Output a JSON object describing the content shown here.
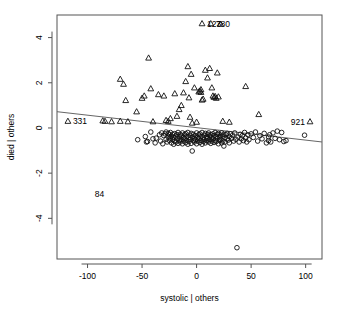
{
  "chart_data": {
    "type": "scatter",
    "title": "",
    "xlabel": "systolic | others",
    "ylabel": "died | others",
    "xlim": [
      -128,
      115
    ],
    "ylim": [
      -5.8,
      5.0
    ],
    "xticks": [
      -100,
      -50,
      0,
      50,
      100
    ],
    "xtick_labels": [
      "-100",
      "-50",
      "0",
      "50",
      "100"
    ],
    "yticks": [
      -4,
      -2,
      0,
      2,
      4
    ],
    "ytick_labels": [
      "-4",
      "-2",
      "0",
      "2",
      "4"
    ],
    "grid": false,
    "legend": "none",
    "regression_line": {
      "x0": -128,
      "y0": 0.72,
      "x1": 115,
      "y1": -0.62
    },
    "annotations": [
      {
        "label": "331",
        "x": -118,
        "y": 0.3,
        "marker": "triangle",
        "align": "right"
      },
      {
        "label": "921",
        "x": 104,
        "y": 0.28,
        "marker": "triangle",
        "align": "left"
      },
      {
        "label": "84",
        "x": -98,
        "y": -2.92,
        "marker": "circle",
        "align": "right"
      },
      {
        "label": "123",
        "x": 5,
        "y": 4.62,
        "marker": "triangle",
        "align": "right"
      },
      {
        "label": "780",
        "x": 13,
        "y": 4.62,
        "marker": "triangle",
        "align": "right"
      }
    ],
    "series": [
      {
        "name": "others (circle)",
        "marker": "circle",
        "points": [
          [
            -54,
            -0.52
          ],
          [
            -47,
            -0.38
          ],
          [
            -46,
            -0.62
          ],
          [
            -45,
            -0.6
          ],
          [
            -42,
            -0.18
          ],
          [
            -40,
            -0.48
          ],
          [
            -38,
            -0.66
          ],
          [
            -37,
            -0.45
          ],
          [
            -34,
            -0.3
          ],
          [
            -33,
            -0.58
          ],
          [
            -32,
            -0.22
          ],
          [
            -31,
            -0.7
          ],
          [
            -30,
            -0.34
          ],
          [
            -29,
            -0.26
          ],
          [
            -28,
            -0.5
          ],
          [
            -28,
            -0.18
          ],
          [
            -27,
            -0.62
          ],
          [
            -26,
            -0.4
          ],
          [
            -26,
            -0.24
          ],
          [
            -25,
            -0.55
          ],
          [
            -25,
            -0.3
          ],
          [
            -24,
            -0.44
          ],
          [
            -24,
            -0.2
          ],
          [
            -23,
            -0.66
          ],
          [
            -23,
            -0.36
          ],
          [
            -22,
            -0.52
          ],
          [
            -22,
            -0.28
          ],
          [
            -21,
            -0.72
          ],
          [
            -21,
            -0.42
          ],
          [
            -20,
            -0.25
          ],
          [
            -20,
            -0.58
          ],
          [
            -19,
            -0.36
          ],
          [
            -19,
            -0.62
          ],
          [
            -18,
            -0.3
          ],
          [
            -18,
            -0.48
          ],
          [
            -17,
            -0.2
          ],
          [
            -17,
            -0.68
          ],
          [
            -16,
            -0.4
          ],
          [
            -16,
            -0.55
          ],
          [
            -15,
            -0.28
          ],
          [
            -15,
            -0.62
          ],
          [
            -14,
            -0.35
          ],
          [
            -14,
            -0.5
          ],
          [
            -13,
            -0.22
          ],
          [
            -13,
            -0.7
          ],
          [
            -12,
            -0.42
          ],
          [
            -12,
            -0.58
          ],
          [
            -11,
            -0.3
          ],
          [
            -11,
            -0.48
          ],
          [
            -10,
            -0.25
          ],
          [
            -10,
            -0.65
          ],
          [
            -9,
            -0.38
          ],
          [
            -9,
            -0.54
          ],
          [
            -8,
            -0.2
          ],
          [
            -8,
            -0.72
          ],
          [
            -7,
            -0.44
          ],
          [
            -7,
            -0.6
          ],
          [
            -6,
            -0.32
          ],
          [
            -6,
            -0.5
          ],
          [
            -5,
            -0.24
          ],
          [
            -5,
            -0.68
          ],
          [
            -4,
            -0.4
          ],
          [
            -4,
            -1.02
          ],
          [
            -3,
            -0.56
          ],
          [
            -3,
            -0.28
          ],
          [
            -2,
            -0.46
          ],
          [
            -2,
            -0.62
          ],
          [
            -1,
            -0.34
          ],
          [
            -1,
            -0.52
          ],
          [
            0,
            -0.22
          ],
          [
            0,
            -0.7
          ],
          [
            1,
            -0.42
          ],
          [
            1,
            -0.58
          ],
          [
            2,
            -0.3
          ],
          [
            2,
            -0.48
          ],
          [
            3,
            -0.26
          ],
          [
            3,
            -0.64
          ],
          [
            4,
            -0.38
          ],
          [
            4,
            -0.54
          ],
          [
            5,
            -0.2
          ],
          [
            5,
            -0.72
          ],
          [
            6,
            -0.44
          ],
          [
            6,
            -0.6
          ],
          [
            7,
            -0.32
          ],
          [
            7,
            -0.5
          ],
          [
            8,
            -0.24
          ],
          [
            8,
            -0.66
          ],
          [
            9,
            -0.4
          ],
          [
            9,
            -0.56
          ],
          [
            10,
            -0.28
          ],
          [
            10,
            -0.46
          ],
          [
            11,
            -0.22
          ],
          [
            11,
            -0.62
          ],
          [
            12,
            -0.36
          ],
          [
            12,
            -0.52
          ],
          [
            13,
            -0.3
          ],
          [
            13,
            -0.68
          ],
          [
            14,
            -0.42
          ],
          [
            14,
            -0.58
          ],
          [
            15,
            -0.26
          ],
          [
            15,
            -0.48
          ],
          [
            16,
            -0.34
          ],
          [
            16,
            -0.64
          ],
          [
            17,
            -0.2
          ],
          [
            17,
            -0.54
          ],
          [
            18,
            -0.38
          ],
          [
            18,
            -0.6
          ],
          [
            19,
            -0.28
          ],
          [
            19,
            -0.46
          ],
          [
            20,
            -0.24
          ],
          [
            20,
            -0.7
          ],
          [
            21,
            -0.4
          ],
          [
            21,
            -0.56
          ],
          [
            22,
            -0.32
          ],
          [
            22,
            -0.5
          ],
          [
            23,
            -0.22
          ],
          [
            23,
            -0.66
          ],
          [
            24,
            -0.36
          ],
          [
            24,
            -0.58
          ],
          [
            25,
            -0.28
          ],
          [
            25,
            -0.8
          ],
          [
            26,
            -0.44
          ],
          [
            26,
            -0.62
          ],
          [
            27,
            -0.3
          ],
          [
            28,
            -0.48
          ],
          [
            28,
            -0.24
          ],
          [
            29,
            -0.54
          ],
          [
            30,
            -0.38
          ],
          [
            30,
            -0.66
          ],
          [
            31,
            -0.26
          ],
          [
            32,
            -0.46
          ],
          [
            33,
            -0.32
          ],
          [
            34,
            -0.58
          ],
          [
            35,
            -0.22
          ],
          [
            36,
            -0.5
          ],
          [
            37,
            -5.3
          ],
          [
            38,
            -0.4
          ],
          [
            39,
            -0.62
          ],
          [
            40,
            -0.28
          ],
          [
            41,
            -0.48
          ],
          [
            42,
            -0.34
          ],
          [
            43,
            -0.56
          ],
          [
            44,
            -0.2
          ],
          [
            45,
            -0.44
          ],
          [
            46,
            -0.62
          ],
          [
            47,
            -0.3
          ],
          [
            48,
            -0.52
          ],
          [
            50,
            -0.26
          ],
          [
            52,
            -0.42
          ],
          [
            54,
            -0.18
          ],
          [
            56,
            -0.58
          ],
          [
            58,
            -0.34
          ],
          [
            60,
            -0.48
          ],
          [
            62,
            -0.24
          ],
          [
            64,
            -0.66
          ],
          [
            66,
            -0.4
          ],
          [
            66,
            -0.56
          ],
          [
            67,
            -0.3
          ],
          [
            68,
            -0.62
          ],
          [
            70,
            -0.22
          ],
          [
            72,
            -0.46
          ],
          [
            74,
            -0.14
          ],
          [
            76,
            -0.52
          ],
          [
            78,
            -0.2
          ],
          [
            80,
            -0.6
          ],
          [
            82,
            -0.56
          ],
          [
            99,
            -0.32
          ]
        ]
      },
      {
        "name": "died (triangle)",
        "marker": "triangle",
        "points": [
          [
            -118,
            0.3
          ],
          [
            -86,
            0.32
          ],
          [
            -84,
            0.3
          ],
          [
            -78,
            0.28
          ],
          [
            -70,
            2.16
          ],
          [
            -70,
            0.3
          ],
          [
            -67,
            1.94
          ],
          [
            -65,
            1.22
          ],
          [
            -63,
            0.28
          ],
          [
            -55,
            0.72
          ],
          [
            -50,
            1.32
          ],
          [
            -48,
            1.42
          ],
          [
            -44,
            3.1
          ],
          [
            -42,
            1.74
          ],
          [
            -40,
            0.28
          ],
          [
            -35,
            1.48
          ],
          [
            -30,
            1.42
          ],
          [
            -28,
            0.34
          ],
          [
            -26,
            0.3
          ],
          [
            -24,
            0.42
          ],
          [
            -20,
            1.52
          ],
          [
            -18,
            0.52
          ],
          [
            -16,
            0.82
          ],
          [
            -14,
            1.0
          ],
          [
            -12,
            1.56
          ],
          [
            -10,
            2.06
          ],
          [
            -8,
            2.72
          ],
          [
            -7,
            1.34
          ],
          [
            -6,
            0.48
          ],
          [
            -5,
            2.38
          ],
          [
            -4,
            0.22
          ],
          [
            -2,
            1.78
          ],
          [
            0,
            0.26
          ],
          [
            2,
            1.6
          ],
          [
            3,
            1.64
          ],
          [
            4,
            1.58
          ],
          [
            4,
            1.7
          ],
          [
            5,
            4.62
          ],
          [
            5,
            1.24
          ],
          [
            6,
            1.28
          ],
          [
            8,
            2.56
          ],
          [
            10,
            2.22
          ],
          [
            12,
            2.64
          ],
          [
            13,
            4.62
          ],
          [
            14,
            1.78
          ],
          [
            15,
            1.42
          ],
          [
            16,
            1.36
          ],
          [
            17,
            1.4
          ],
          [
            18,
            1.32
          ],
          [
            19,
            2.44
          ],
          [
            20,
            1.38
          ],
          [
            22,
            4.6
          ],
          [
            24,
            0.3
          ],
          [
            30,
            0.26
          ],
          [
            45,
            1.84
          ],
          [
            57,
            0.6
          ],
          [
            104,
            0.28
          ]
        ]
      }
    ]
  },
  "plot_geometry": {
    "frame_left": 57,
    "frame_top": 15,
    "frame_right": 322,
    "frame_bottom": 259
  }
}
